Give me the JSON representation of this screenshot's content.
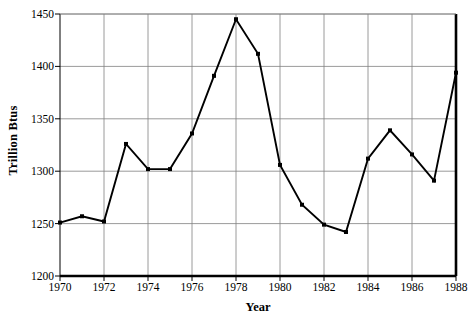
{
  "chart_data": {
    "type": "line",
    "title": "",
    "xlabel": "Year",
    "ylabel": "Trillion Btus",
    "x": [
      1970,
      1971,
      1972,
      1973,
      1974,
      1975,
      1976,
      1977,
      1978,
      1979,
      1980,
      1981,
      1982,
      1983,
      1984,
      1985,
      1986,
      1987,
      1988
    ],
    "values": [
      1251,
      1257,
      1252,
      1326,
      1302,
      1302,
      1336,
      1391,
      1445,
      1412,
      1306,
      1268,
      1249,
      1242,
      1312,
      1339,
      1316,
      1291,
      1394
    ],
    "series": [
      {
        "name": "Trillion Btus",
        "values": [
          1251,
          1257,
          1252,
          1326,
          1302,
          1302,
          1336,
          1391,
          1445,
          1412,
          1306,
          1268,
          1249,
          1242,
          1312,
          1339,
          1316,
          1291,
          1394
        ]
      }
    ],
    "xlim": [
      1970,
      1988
    ],
    "ylim": [
      1200,
      1450
    ],
    "ytick_labels": [
      "1200",
      "1250",
      "1300",
      "1350",
      "1400",
      "1450"
    ],
    "ytick_values": [
      1200,
      1250,
      1300,
      1350,
      1400,
      1450
    ],
    "xtick_labels": [
      "1970",
      "1972",
      "1974",
      "1976",
      "1978",
      "1980",
      "1982",
      "1984",
      "1986",
      "1988"
    ],
    "xtick_values": [
      1970,
      1972,
      1974,
      1976,
      1978,
      1980,
      1982,
      1984,
      1986,
      1988
    ],
    "grid": true,
    "grid_axis": "both",
    "legend": "none",
    "line_color": "#000000",
    "marker": "square",
    "marker_color": "#000000",
    "grid_color": "#808080",
    "axis_color": "#000000",
    "background": "#ffffff"
  }
}
